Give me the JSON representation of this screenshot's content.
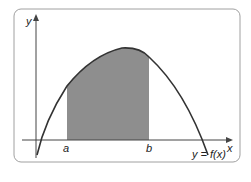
{
  "diagram": {
    "type": "definite-integral-area",
    "axes": {
      "x_label": "x",
      "y_label": "y"
    },
    "bounds": {
      "lower": "a",
      "upper": "b"
    },
    "curve_label": "y = f(x)",
    "colors": {
      "frame": "#9a9a9a",
      "shaded": "#8c8c8c",
      "curve": "#333333",
      "axes": "#444444"
    }
  }
}
